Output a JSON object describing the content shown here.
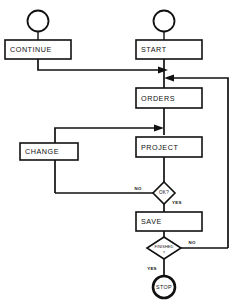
{
  "diagram": {
    "type": "flowchart",
    "stroke_color": "#111111",
    "fill_color": "#ffffff",
    "nodes": {
      "continue_connector": {
        "label": "",
        "shape": "circle"
      },
      "continue": {
        "label": "CONTINUE",
        "shape": "process"
      },
      "start_connector": {
        "label": "",
        "shape": "circle"
      },
      "start": {
        "label": "START",
        "shape": "process"
      },
      "orders": {
        "label": "ORDERS",
        "shape": "process"
      },
      "change": {
        "label": "CHANGE",
        "shape": "process"
      },
      "project": {
        "label": "PROJECT",
        "shape": "process"
      },
      "ok_decision": {
        "label": "OK?",
        "shape": "decision"
      },
      "save": {
        "label": "SAVE",
        "shape": "process"
      },
      "finished_decision": {
        "label_line1": "FINISHED",
        "label_line2": "?",
        "shape": "decision"
      },
      "stop": {
        "label": "STOP",
        "shape": "terminator"
      }
    },
    "edge_labels": {
      "ok_no": "NO",
      "ok_yes": "YES",
      "finished_no": "NO",
      "finished_yes": "YES"
    }
  }
}
